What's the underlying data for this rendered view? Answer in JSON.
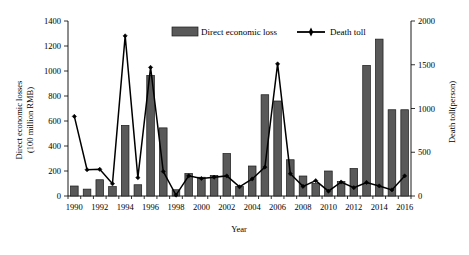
{
  "chart_data": {
    "type": "bar",
    "title": "",
    "xlabel": "Year",
    "ylabel": "Direct economic losses\n(100 million RMB)",
    "y2label": "Death toll(person)",
    "ylim": [
      0,
      1400
    ],
    "y2lim": [
      0,
      2000
    ],
    "yticks": [
      0,
      200,
      400,
      600,
      800,
      1000,
      1200,
      1400
    ],
    "y2ticks": [
      0,
      500,
      1000,
      1500,
      2000
    ],
    "xticks": [
      1990,
      1992,
      1994,
      1996,
      1998,
      2000,
      2002,
      2004,
      2006,
      2008,
      2010,
      2012,
      2014,
      2016
    ],
    "grid": false,
    "legend_position": "top-center",
    "categories": [
      1990,
      1991,
      1992,
      1993,
      1994,
      1995,
      1996,
      1997,
      1998,
      1999,
      2000,
      2001,
      2002,
      2003,
      2004,
      2005,
      2006,
      2007,
      2008,
      2009,
      2010,
      2011,
      2012,
      2013,
      2014,
      2015,
      2016
    ],
    "series": [
      {
        "name": "Direct economic loss",
        "type": "bar",
        "axis": "left",
        "unit": "100 million RMB",
        "values": [
          80,
          55,
          130,
          75,
          565,
          90,
          965,
          545,
          50,
          180,
          150,
          165,
          340,
          75,
          240,
          810,
          760,
          290,
          160,
          100,
          200,
          115,
          220,
          1045,
          1255,
          690,
          690
        ]
      },
      {
        "name": "Death toll",
        "type": "line",
        "axis": "right",
        "unit": "person",
        "values": [
          910,
          300,
          305,
          140,
          1830,
          210,
          1470,
          280,
          10,
          230,
          200,
          215,
          230,
          105,
          195,
          330,
          1510,
          255,
          110,
          175,
          55,
          160,
          95,
          155,
          115,
          70,
          230
        ]
      }
    ],
    "legend": [
      {
        "label": "Direct economic loss",
        "marker": "bar-swatch",
        "color": "#595959"
      },
      {
        "label": "Death toll",
        "marker": "line-with-point",
        "color": "#000000"
      }
    ]
  }
}
